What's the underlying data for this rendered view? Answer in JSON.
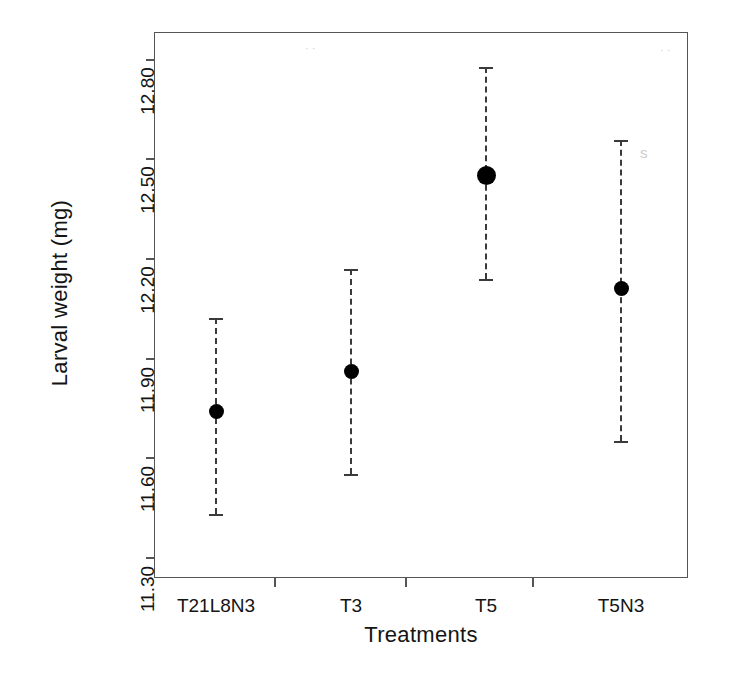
{
  "chart_data": {
    "type": "scatter",
    "title": "",
    "xlabel": "Treatments",
    "ylabel": "Larval weight (mg)",
    "categories": [
      "T21L8N3",
      "T3",
      "T5",
      "T5N3"
    ],
    "values": [
      11.74,
      11.86,
      12.45,
      12.11
    ],
    "error_low": [
      11.43,
      11.55,
      12.14,
      11.65
    ],
    "error_high": [
      12.02,
      12.17,
      12.78,
      12.56
    ],
    "yticks": [
      "11.30",
      "11.60",
      "11.90",
      "12.20",
      "12.50",
      "12.80"
    ],
    "ytick_values": [
      11.3,
      11.6,
      11.9,
      12.2,
      12.5,
      12.8
    ],
    "ylim": [
      11.3,
      12.8
    ],
    "xlim": [
      0.5,
      4.5
    ],
    "grid": false,
    "legend": "none",
    "marker": "filled-circle",
    "errorbar_style": "dashed-with-caps",
    "series": [
      {
        "name": "Larval weight",
        "points": [
          {
            "category": "T21L8N3",
            "value": 11.74,
            "low": 11.43,
            "high": 12.02
          },
          {
            "category": "T3",
            "value": 11.86,
            "low": 11.55,
            "high": 12.17
          },
          {
            "category": "T5",
            "value": 12.45,
            "low": 12.14,
            "high": 12.78
          },
          {
            "category": "T5N3",
            "value": 12.11,
            "low": 11.65,
            "high": 12.56
          }
        ]
      }
    ]
  },
  "axes": {
    "y_title": "Larval weight (mg)",
    "x_title": "Treatments",
    "y_tick_labels": [
      "12.80",
      "12.50",
      "12.20",
      "11.90",
      "11.60",
      "11.30"
    ],
    "x_tick_labels": [
      "T21L8N3",
      "T3",
      "T5",
      "T5N3"
    ]
  },
  "colors": {
    "marker": "#000000",
    "errorbar": "#3a3a3a",
    "frame": "#555555",
    "background": "#ffffff",
    "text": "#141414"
  },
  "artifacts": {
    "scan_mark_top": "·  ·",
    "scan_mark_right": "· ·",
    "scan_mark_t5n3": "s"
  }
}
